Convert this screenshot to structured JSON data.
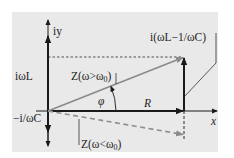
{
  "diagram": {
    "colors": {
      "panel": "#e9e9e9",
      "axis": "#1a1a1a",
      "impedance_vector": "#8a8a8a",
      "dashed_vector": "#8e8e8e",
      "text": "#1e1e1e"
    },
    "labels": {
      "imag_axis": "iy",
      "real_axis": "x",
      "inductive": "iωL",
      "capacitive": "−i/ωC",
      "z_above": "Z(ω>ω",
      "z_above_sub": "0",
      "z_above_close": ")",
      "z_below": "Z(ω<ω",
      "z_below_sub": "0",
      "z_below_close": ")",
      "resistance": "R",
      "phase": "φ",
      "reactance": "i(ωL−1/ωC)"
    }
  }
}
